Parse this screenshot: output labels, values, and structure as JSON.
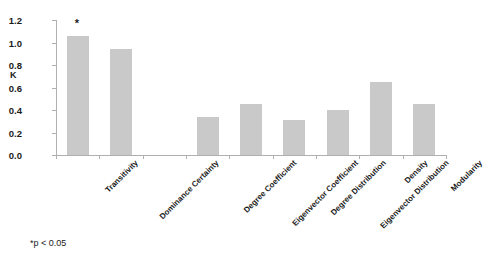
{
  "chart_data": {
    "type": "bar",
    "title": "",
    "subtitle": "",
    "xlabel": "",
    "ylabel": "K",
    "ylim": [
      0.0,
      1.2
    ],
    "yticks": [
      "0.0",
      "0.2",
      "0.4",
      "0.6",
      "0.8",
      "1.0",
      "1.2"
    ],
    "ytick_values": [
      0.0,
      0.2,
      0.4,
      0.6,
      0.8,
      1.0,
      1.2
    ],
    "grid": false,
    "legend": null,
    "legend_position": "none",
    "categories": [
      "Transitivity",
      "Dominance Certainty",
      "Degree Coefficient",
      "Eigenvector Coefficient",
      "Degree Distribution",
      "Eigenvector Distribution",
      "Density",
      "Modularity"
    ],
    "values": [
      1.06,
      0.94,
      0.34,
      0.45,
      0.31,
      0.4,
      0.65,
      0.45
    ],
    "annotations": [
      {
        "label": "*",
        "category": "Transitivity",
        "value": 1.06
      }
    ],
    "footnote": "*p < 0.05"
  },
  "axis": {
    "y_title": "K"
  },
  "colors": {
    "bar_fill": "#c9c9c9",
    "axis": "#b0b0b0",
    "text": "#1a1a1a",
    "background": "#ffffff"
  }
}
